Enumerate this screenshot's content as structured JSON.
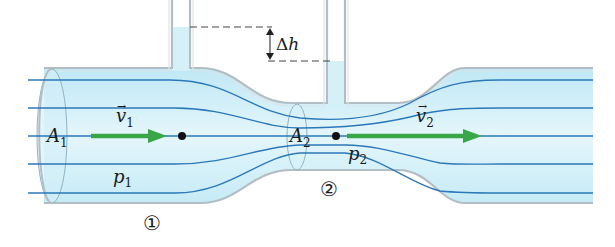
{
  "figure": {
    "colors": {
      "fluid": "#cdeef8",
      "fluid_light": "#e6f7fc",
      "wall": "#b9c3c8",
      "streamline": "#2a78b8",
      "velocity_arrow": "#3aa64a",
      "point": "#111111",
      "dashed": "#444444"
    },
    "labels": {
      "A1": {
        "main": "A",
        "sub": "1"
      },
      "A2": {
        "main": "A",
        "sub": "2"
      },
      "v1": {
        "main": "v",
        "sub": "1",
        "arrow": "→"
      },
      "v2": {
        "main": "v",
        "sub": "2",
        "arrow": "→"
      },
      "p1": {
        "main": "p",
        "sub": "1"
      },
      "p2": {
        "main": "p",
        "sub": "2"
      },
      "delta_h": {
        "delta": "Δ",
        "main": "h"
      },
      "region1": "①",
      "region2": "②"
    }
  }
}
